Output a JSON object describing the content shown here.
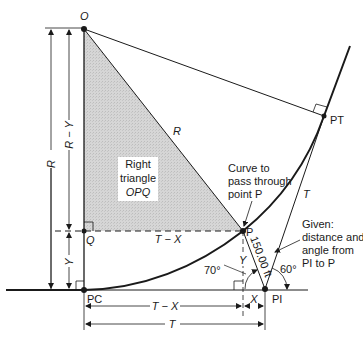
{
  "diagram": {
    "type": "horizontal circular curve geometry",
    "points": {
      "O": "O",
      "PT": "PT",
      "P": "P",
      "PI": "PI",
      "PC": "PC",
      "Q": "Q"
    },
    "triangle_label": {
      "line1": "Right",
      "line2": "triangle",
      "line3": "OPQ"
    },
    "radius_label": "R",
    "tangent_label": "T",
    "dimensions": {
      "R": "R",
      "R_minus_Y": "R − Y",
      "Y_left": "Y",
      "Y_vertical": "Y",
      "T_minus_X_horizontal": "T − X",
      "T_minus_X_bottom": "T − X",
      "X": "X",
      "T_bottom": "T",
      "distance_P_PI": "150.00 ft"
    },
    "angles": {
      "left": "70°",
      "right": "60°"
    },
    "annotations": {
      "curve_note": [
        "Curve to",
        "pass through",
        "point P"
      ],
      "given_note": [
        "Given:",
        "distance and",
        "angle from",
        "PI to P"
      ]
    },
    "colors": {
      "line": "#1a1a1a",
      "shade": "#d4d4d4",
      "background": "#ffffff"
    }
  }
}
